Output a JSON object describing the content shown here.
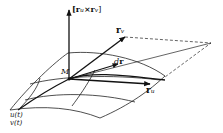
{
  "figure": {
    "labels": {
      "normal": "[r",
      "normal_u": "u",
      "normal_times": "×r",
      "normal_v": "v",
      "normal_close": "]",
      "rv_base": "r",
      "rv_sub": "v",
      "ru_base": "r",
      "ru_sub": "u",
      "dr_d": "d",
      "dr_r": "r",
      "point": "M",
      "curve_u": "u(t)",
      "curve_v": "v(t)"
    },
    "colors": {
      "ink": "#111111",
      "background": "#ffffff"
    }
  }
}
